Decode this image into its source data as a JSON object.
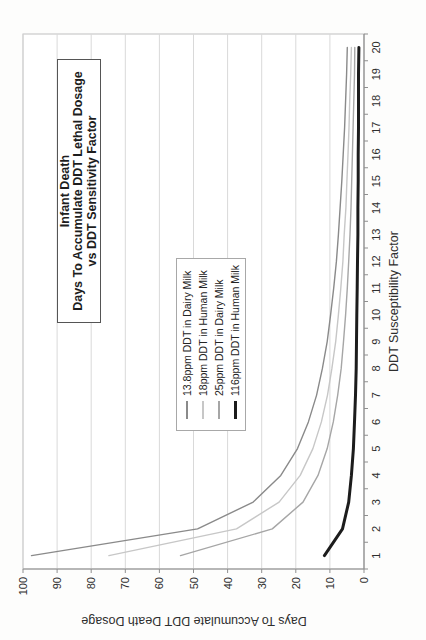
{
  "chart_data": {
    "type": "line",
    "title_lines": [
      "Infant Death",
      "Days To Accumulate DDT Lethal Dosage",
      "vs DDT Sensitivity Factor"
    ],
    "xlabel": "DDT Susceptibility Factor",
    "ylabel": "Days To Accumulate DDT Death Dosage",
    "x": [
      1,
      2,
      3,
      4,
      5,
      6,
      7,
      8,
      9,
      10,
      11,
      12,
      13,
      14,
      15,
      16,
      17,
      18,
      19,
      20
    ],
    "x_ticks": [
      1,
      2,
      3,
      4,
      5,
      6,
      7,
      8,
      9,
      10,
      11,
      12,
      13,
      14,
      15,
      16,
      17,
      18,
      19,
      20
    ],
    "y_ticks": [
      0,
      10,
      20,
      30,
      40,
      50,
      60,
      70,
      80,
      90,
      100
    ],
    "xlim": [
      1,
      20
    ],
    "ylim": [
      0,
      100
    ],
    "grid": "horizontal-major-only",
    "legend_position": "inside-center-left",
    "series": [
      {
        "name": "13.8ppm DDT in Dairy Milk",
        "color": "#8a8a8a",
        "width": 1.4,
        "values": [
          97.5,
          48.8,
          32.5,
          24.4,
          19.5,
          16.3,
          13.9,
          12.2,
          10.8,
          9.8,
          8.9,
          8.1,
          7.5,
          7.0,
          6.5,
          6.1,
          5.7,
          5.4,
          5.1,
          4.9
        ]
      },
      {
        "name": "18ppm DDT in Human Milk",
        "color": "#c7c7c7",
        "width": 1.4,
        "values": [
          74.8,
          37.4,
          24.9,
          18.7,
          15.0,
          12.5,
          10.7,
          9.4,
          8.3,
          7.5,
          6.8,
          6.2,
          5.8,
          5.3,
          5.0,
          4.7,
          4.4,
          4.2,
          3.9,
          3.7
        ]
      },
      {
        "name": "25ppm DDT in Dairy Milk",
        "color": "#a6a6a6",
        "width": 1.4,
        "values": [
          53.8,
          26.9,
          17.9,
          13.5,
          10.8,
          9.0,
          7.7,
          6.7,
          6.0,
          5.4,
          4.9,
          4.5,
          4.1,
          3.8,
          3.6,
          3.4,
          3.2,
          3.0,
          2.8,
          2.7
        ]
      },
      {
        "name": "116ppm DDT in Human Milk",
        "color": "#1c1c1c",
        "width": 3,
        "values": [
          11.6,
          6.3,
          4.5,
          3.7,
          3.1,
          2.8,
          2.5,
          2.3,
          2.2,
          2.1,
          2.0,
          1.9,
          1.8,
          1.8,
          1.7,
          1.7,
          1.6,
          1.6,
          1.6,
          1.5
        ]
      }
    ],
    "colors": {
      "axis": "#8f8f8f",
      "grid": "#d9d9d9",
      "plot_border": "#bfbfbf",
      "plot_background": "#ffffff",
      "text": "#2e2e2e"
    }
  }
}
